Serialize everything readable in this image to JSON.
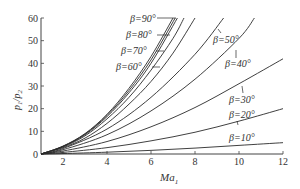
{
  "chart_data": {
    "type": "line",
    "title": "",
    "xlabel": "Ma1",
    "ylabel": "p1/p2",
    "xlim": [
      1,
      12
    ],
    "ylim": [
      0,
      60
    ],
    "xticks": [
      2,
      4,
      6,
      8,
      10,
      12
    ],
    "yticks": [
      0,
      10,
      20,
      30,
      40,
      50,
      60
    ],
    "grid": false,
    "legend": "inline labels",
    "series": [
      {
        "name": "β=90°",
        "label": "β=90°",
        "x": [
          1,
          2,
          3,
          4,
          5,
          6,
          7.0
        ],
        "values": [
          0,
          3.5,
          9,
          17.5,
          29,
          43,
          60
        ]
      },
      {
        "name": "β=80°",
        "label": "β=80°",
        "x": [
          1,
          2,
          3,
          4,
          5,
          6,
          7.1
        ],
        "values": [
          0,
          3.4,
          8.8,
          17,
          28,
          41.5,
          60
        ]
      },
      {
        "name": "β=70°",
        "label": "β=70°",
        "x": [
          1,
          2,
          3,
          4,
          5,
          6,
          7.2
        ],
        "values": [
          0,
          3.3,
          8.5,
          16.5,
          27,
          40,
          60
        ]
      },
      {
        "name": "β=60°",
        "label": "β=60°",
        "x": [
          1,
          2,
          3,
          4,
          5,
          6,
          7,
          7.5
        ],
        "values": [
          0,
          3.1,
          8,
          15.5,
          25,
          37,
          51,
          60
        ]
      },
      {
        "name": "unlabeled",
        "label": "",
        "x": [
          1,
          2,
          3,
          4,
          5,
          6,
          7,
          8.0
        ],
        "values": [
          0,
          2.8,
          7,
          13.5,
          22,
          32,
          44.5,
          60
        ]
      },
      {
        "name": "β=50°",
        "label": "β=50°",
        "x": [
          1,
          2,
          4,
          6,
          8,
          9.3
        ],
        "values": [
          0,
          2.4,
          11,
          25,
          44,
          60
        ]
      },
      {
        "name": "β=40°",
        "label": "β=40°",
        "x": [
          1,
          2,
          4,
          6,
          8,
          10,
          10.7
        ],
        "values": [
          0,
          1.9,
          8.5,
          19,
          33,
          51,
          60
        ]
      },
      {
        "name": "β=30°",
        "label": "β=30°",
        "x": [
          1,
          2,
          4,
          6,
          8,
          10,
          12
        ],
        "values": [
          0,
          1.3,
          5.5,
          12,
          20.5,
          31,
          42
        ]
      },
      {
        "name": "β=20°",
        "label": "β=20°",
        "x": [
          1,
          2,
          4,
          6,
          8,
          10,
          12
        ],
        "values": [
          0,
          0.7,
          2.8,
          5.8,
          9.6,
          14.5,
          20
        ]
      },
      {
        "name": "β=10°",
        "label": "β=10°",
        "x": [
          1,
          2,
          4,
          6,
          8,
          10,
          12
        ],
        "values": [
          0,
          0.2,
          0.8,
          1.6,
          2.6,
          3.8,
          5
        ]
      }
    ],
    "annotations": [
      "β=90°",
      "β=80°",
      "β=70°",
      "β=60°",
      "β=50°",
      "β=40°",
      "β=30°",
      "β=20°",
      "β=10°"
    ]
  },
  "axes": {
    "x_label": "Ma",
    "x_label_sub": "1",
    "y_label_p1": "p",
    "y_label_sub1": "1",
    "y_label_slash": "/",
    "y_label_p2": "p",
    "y_label_sub2": "2"
  },
  "colors": {
    "line": "#2a2a2a",
    "axis": "#444444",
    "text": "#333333"
  }
}
